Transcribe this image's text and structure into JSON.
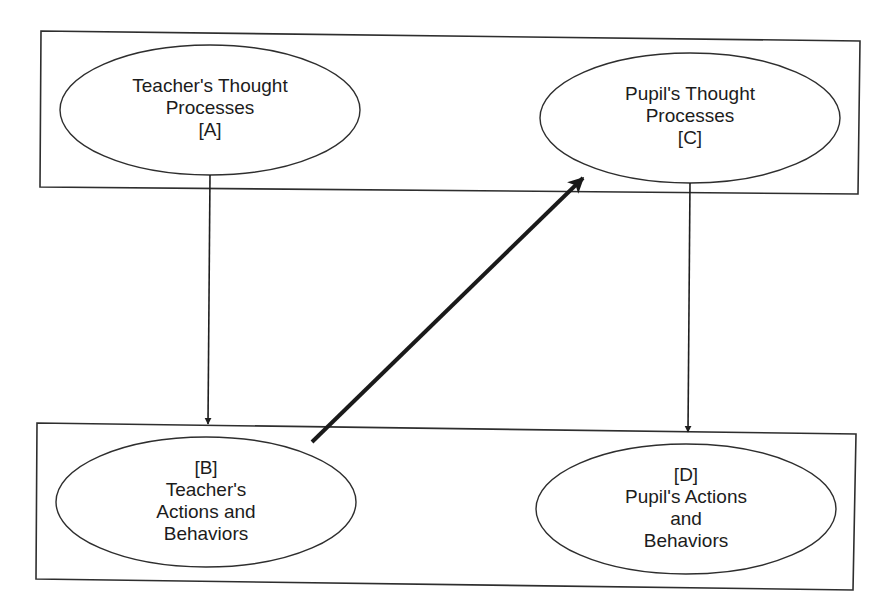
{
  "diagram": {
    "type": "flow-model",
    "groups": [
      {
        "id": "top-box",
        "label": "Thought processes (unobservable)",
        "contains": [
          "A",
          "C"
        ]
      },
      {
        "id": "bottom-box",
        "label": "Actions and behaviors (observable)",
        "contains": [
          "B",
          "D"
        ]
      }
    ],
    "nodes": {
      "A": {
        "id": "A",
        "lines": [
          "Teacher's Thought",
          "Processes",
          "[A]"
        ],
        "full_label": "Teacher's Thought Processes [A]"
      },
      "B": {
        "id": "B",
        "lines": [
          "[B]",
          "Teacher's",
          "Actions and",
          "Behaviors"
        ],
        "full_label": "[B] Teacher's Actions and Behaviors"
      },
      "C": {
        "id": "C",
        "lines": [
          "Pupil's Thought",
          "Processes",
          "[C]"
        ],
        "full_label": "Pupil's Thought Processes [C]"
      },
      "D": {
        "id": "D",
        "lines": [
          "[D]",
          "Pupil's Actions",
          "and",
          "Behaviors"
        ],
        "full_label": "[D] Pupil's Actions and Behaviors"
      }
    },
    "edges": [
      {
        "from": "A",
        "to": "B",
        "style": "thin"
      },
      {
        "from": "B",
        "to": "C",
        "style": "bold"
      },
      {
        "from": "C",
        "to": "D",
        "style": "thin"
      }
    ],
    "colors": {
      "stroke": "#2a2a2a",
      "background": "#ffffff",
      "text": "#1c1c1c"
    }
  }
}
